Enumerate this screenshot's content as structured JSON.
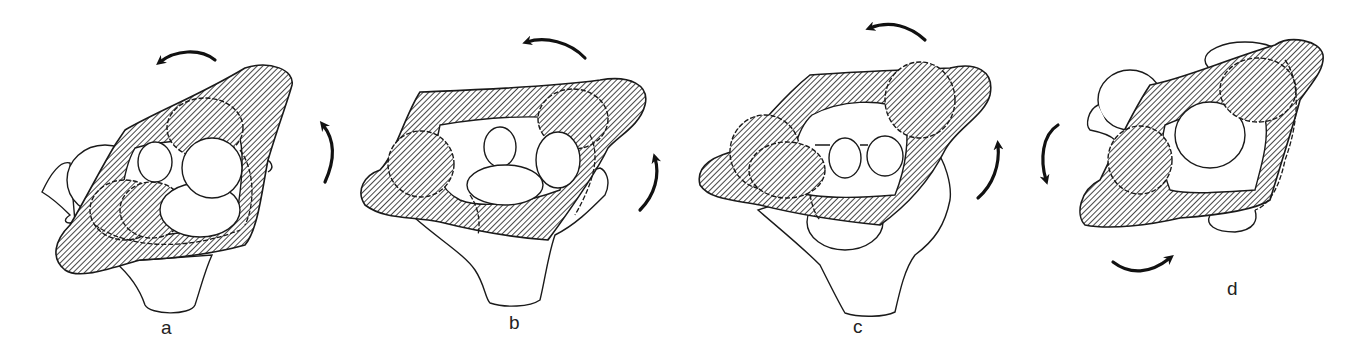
{
  "figure": {
    "colors": {
      "ink": "#1a1a1a",
      "background": "#ffffff"
    },
    "panels": [
      {
        "id": "a",
        "label": "a",
        "arrows": [
          "counterclockwise-top",
          "counterclockwise-right"
        ]
      },
      {
        "id": "b",
        "label": "b",
        "arrows": [
          "counterclockwise-top",
          "counterclockwise-right"
        ]
      },
      {
        "id": "c",
        "label": "c",
        "arrows": [
          "counterclockwise-top",
          "counterclockwise-right"
        ]
      },
      {
        "id": "d",
        "label": "d",
        "arrows": [
          "counterclockwise-left",
          "clockwise-bottom"
        ]
      }
    ]
  }
}
